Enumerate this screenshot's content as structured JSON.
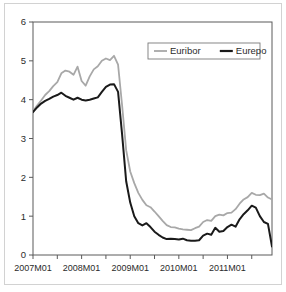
{
  "chart_data": {
    "type": "line",
    "title": "",
    "subtitle": "",
    "xlabel": "",
    "ylabel": "",
    "xlim": [
      "2007M01",
      "2011M12"
    ],
    "ylim": [
      0,
      6
    ],
    "ytick_labels": [
      "0",
      "1",
      "2",
      "3",
      "4",
      "5",
      "6"
    ],
    "ytick_values": [
      0,
      1,
      2,
      3,
      4,
      5,
      6
    ],
    "xtick_labels": [
      "2007M01",
      "2008M01",
      "2009M01",
      "2010M01",
      "2011M01"
    ],
    "xtick_label_positions": [
      0,
      12,
      24,
      36,
      48
    ],
    "xtick_minor_positions": [
      0,
      6,
      12,
      18,
      24,
      30,
      36,
      42,
      48,
      54
    ],
    "grid": false,
    "legend_position": "top-right",
    "x": [
      "2007M01",
      "2007M02",
      "2007M03",
      "2007M04",
      "2007M05",
      "2007M06",
      "2007M07",
      "2007M08",
      "2007M09",
      "2007M10",
      "2007M11",
      "2007M12",
      "2008M01",
      "2008M02",
      "2008M03",
      "2008M04",
      "2008M05",
      "2008M06",
      "2008M07",
      "2008M08",
      "2008M09",
      "2008M10",
      "2008M11",
      "2008M12",
      "2009M01",
      "2009M02",
      "2009M03",
      "2009M04",
      "2009M05",
      "2009M06",
      "2009M07",
      "2009M08",
      "2009M09",
      "2009M10",
      "2009M11",
      "2009M12",
      "2010M01",
      "2010M02",
      "2010M03",
      "2010M04",
      "2010M05",
      "2010M06",
      "2010M07",
      "2010M08",
      "2010M09",
      "2010M10",
      "2010M11",
      "2010M12",
      "2011M01",
      "2011M02",
      "2011M03",
      "2011M04",
      "2011M05",
      "2011M06",
      "2011M07",
      "2011M08",
      "2011M09",
      "2011M10",
      "2011M11",
      "2011M12"
    ],
    "series": [
      {
        "name": "Euribor",
        "color": "#a8a8a8",
        "values": [
          3.7,
          3.85,
          3.98,
          4.12,
          4.22,
          4.35,
          4.45,
          4.68,
          4.75,
          4.72,
          4.64,
          4.85,
          4.48,
          4.36,
          4.6,
          4.78,
          4.86,
          5.0,
          5.06,
          5.02,
          5.13,
          4.9,
          3.85,
          2.7,
          2.15,
          1.85,
          1.6,
          1.42,
          1.28,
          1.23,
          1.12,
          1.0,
          0.88,
          0.77,
          0.72,
          0.71,
          0.68,
          0.66,
          0.65,
          0.64,
          0.69,
          0.73,
          0.85,
          0.9,
          0.88,
          1.0,
          1.04,
          1.02,
          1.08,
          1.09,
          1.18,
          1.32,
          1.43,
          1.49,
          1.6,
          1.55,
          1.54,
          1.58,
          1.48,
          1.43
        ]
      },
      {
        "name": "Eurepo",
        "color": "#1a1a1a",
        "values": [
          3.68,
          3.8,
          3.9,
          3.97,
          4.02,
          4.08,
          4.12,
          4.18,
          4.1,
          4.05,
          4.0,
          4.05,
          4.0,
          3.98,
          4.0,
          4.03,
          4.06,
          4.2,
          4.33,
          4.39,
          4.4,
          4.2,
          3.1,
          1.9,
          1.35,
          1.0,
          0.82,
          0.76,
          0.82,
          0.72,
          0.6,
          0.52,
          0.45,
          0.41,
          0.42,
          0.41,
          0.4,
          0.42,
          0.38,
          0.37,
          0.37,
          0.38,
          0.5,
          0.55,
          0.52,
          0.7,
          0.6,
          0.62,
          0.72,
          0.78,
          0.73,
          0.92,
          1.05,
          1.15,
          1.27,
          1.22,
          1.0,
          0.85,
          0.8,
          0.22
        ]
      }
    ]
  },
  "legend": {
    "items": [
      {
        "label": "Euribor",
        "color": "#a8a8a8"
      },
      {
        "label": "Eurepo",
        "color": "#1a1a1a"
      }
    ]
  },
  "axes": {
    "y_labels": [
      "6",
      "5",
      "4",
      "3",
      "2",
      "1",
      "0"
    ],
    "x_labels": [
      "2007M01",
      "2008M01",
      "2009M01",
      "2010M01",
      "2011M01"
    ]
  }
}
